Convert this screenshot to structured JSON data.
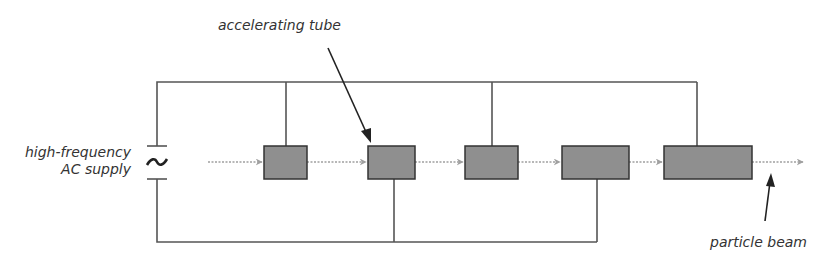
{
  "diagram": {
    "labels": {
      "supply_line1": "high-frequency",
      "supply_line2": "AC supply",
      "tube": "accelerating tube",
      "beam": "particle beam",
      "ac_symbol": "~"
    },
    "colors": {
      "wire": "#555555",
      "tube_fill": "#8f8f8f",
      "tube_stroke": "#333333",
      "beam": "#a0a0a0",
      "pointer": "#222222",
      "text": "#333333"
    },
    "tubes": [
      {
        "x": 264,
        "y": 146,
        "w": 43,
        "h": 33,
        "connects_to": "top"
      },
      {
        "x": 368,
        "y": 146,
        "w": 47,
        "h": 33,
        "connects_to": "bottom"
      },
      {
        "x": 465,
        "y": 146,
        "w": 53,
        "h": 33,
        "connects_to": "top"
      },
      {
        "x": 562,
        "y": 146,
        "w": 67,
        "h": 33,
        "connects_to": "bottom"
      },
      {
        "x": 664,
        "y": 146,
        "w": 88,
        "h": 33,
        "connects_to": "top"
      }
    ]
  }
}
